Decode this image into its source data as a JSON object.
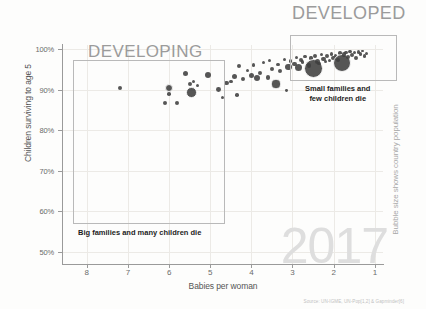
{
  "chart": {
    "type": "scatter",
    "title": "",
    "year_watermark": "2017",
    "source_note": "Source: UN-IGME, UN-Pop[1,2] & Gapminder[6]",
    "xlabel": "Babies per woman",
    "ylabel": "Children surviving to age 5",
    "right_label": "Bubble size shows country population"
  },
  "axes": {
    "x_ticks": [
      "8",
      "7",
      "6",
      "5",
      "4",
      "3",
      "2",
      "1"
    ],
    "y_ticks": [
      "100%",
      "90%",
      "80%",
      "70%",
      "60%",
      "50%"
    ],
    "xlim": [
      8.6,
      0.8
    ],
    "ylim": [
      47,
      101
    ],
    "x_reversed": true,
    "grid": true
  },
  "regions": [
    {
      "name": "developing",
      "heading": "DEVELOPING",
      "caption": "Big families and many children die",
      "x_range": [
        8.3,
        5.0
      ],
      "y_range": [
        55,
        95
      ]
    },
    {
      "name": "developed",
      "heading": "DEVELOPED",
      "caption_line1": "Small families and",
      "caption_line2": "few children die",
      "x_range": [
        3.0,
        1.0
      ],
      "y_range": [
        93,
        100
      ]
    }
  ],
  "colors": {
    "bubble": "#3f3f3f",
    "region_border": "#b9b9b9",
    "heading": "#9b9b9b",
    "watermark": "#dedede",
    "axis": "#9a9a9a",
    "grid": "#eceae6",
    "tick_text": "#6b6b6b"
  },
  "chart_data": {
    "type": "scatter",
    "xlabel": "Babies per woman",
    "ylabel": "Children surviving to age 5",
    "size_encoding": "Bubble size shows country population",
    "xlim": [
      8.6,
      0.8
    ],
    "ylim": [
      47,
      101
    ],
    "x_reversed": true,
    "grid": true,
    "legend": "none",
    "annotations": [
      "DEVELOPING",
      "DEVELOPED",
      "Big families and many children die",
      "Small families and few children die",
      "2017",
      "Bubble size shows country population"
    ],
    "points": [
      {
        "x": 7.2,
        "y": 90.3,
        "r": 2.0
      },
      {
        "x": 6.1,
        "y": 86.6,
        "r": 2.0
      },
      {
        "x": 6.0,
        "y": 90.4,
        "r": 4.2
      },
      {
        "x": 6.0,
        "y": 88.9,
        "r": 1.8
      },
      {
        "x": 5.8,
        "y": 86.8,
        "r": 2.0
      },
      {
        "x": 5.6,
        "y": 94.0,
        "r": 2.8
      },
      {
        "x": 5.5,
        "y": 91.4,
        "r": 2.0
      },
      {
        "x": 5.45,
        "y": 89.3,
        "r": 5.2
      },
      {
        "x": 5.4,
        "y": 92.0,
        "r": 1.8
      },
      {
        "x": 5.3,
        "y": 91.0,
        "r": 1.6
      },
      {
        "x": 5.05,
        "y": 93.7,
        "r": 3.0
      },
      {
        "x": 4.8,
        "y": 90.0,
        "r": 2.4
      },
      {
        "x": 4.7,
        "y": 88.0,
        "r": 1.6
      },
      {
        "x": 4.6,
        "y": 91.6,
        "r": 2.2
      },
      {
        "x": 4.5,
        "y": 92.0,
        "r": 1.8
      },
      {
        "x": 4.4,
        "y": 93.2,
        "r": 2.6
      },
      {
        "x": 4.35,
        "y": 88.6,
        "r": 1.8
      },
      {
        "x": 4.3,
        "y": 95.8,
        "r": 2.0
      },
      {
        "x": 4.2,
        "y": 92.6,
        "r": 2.2
      },
      {
        "x": 4.1,
        "y": 94.7,
        "r": 1.6
      },
      {
        "x": 4.0,
        "y": 93.4,
        "r": 2.6
      },
      {
        "x": 3.95,
        "y": 96.0,
        "r": 1.8
      },
      {
        "x": 3.85,
        "y": 92.8,
        "r": 3.0
      },
      {
        "x": 3.8,
        "y": 94.2,
        "r": 2.0
      },
      {
        "x": 3.7,
        "y": 96.6,
        "r": 1.6
      },
      {
        "x": 3.6,
        "y": 93.0,
        "r": 2.2
      },
      {
        "x": 3.55,
        "y": 97.2,
        "r": 1.6
      },
      {
        "x": 3.5,
        "y": 95.0,
        "r": 2.0
      },
      {
        "x": 3.4,
        "y": 91.4,
        "r": 4.6
      },
      {
        "x": 3.35,
        "y": 96.2,
        "r": 1.8
      },
      {
        "x": 3.3,
        "y": 94.6,
        "r": 2.0
      },
      {
        "x": 3.2,
        "y": 97.5,
        "r": 1.6
      },
      {
        "x": 3.15,
        "y": 89.8,
        "r": 1.4
      },
      {
        "x": 3.1,
        "y": 95.6,
        "r": 3.2
      },
      {
        "x": 3.05,
        "y": 97.0,
        "r": 1.8
      },
      {
        "x": 2.95,
        "y": 96.3,
        "r": 2.2
      },
      {
        "x": 2.9,
        "y": 98.0,
        "r": 1.6
      },
      {
        "x": 2.85,
        "y": 95.4,
        "r": 3.6
      },
      {
        "x": 2.8,
        "y": 97.4,
        "r": 2.0
      },
      {
        "x": 2.75,
        "y": 96.8,
        "r": 1.6
      },
      {
        "x": 2.7,
        "y": 98.2,
        "r": 1.8
      },
      {
        "x": 2.6,
        "y": 96.0,
        "r": 2.4
      },
      {
        "x": 2.55,
        "y": 97.8,
        "r": 1.6
      },
      {
        "x": 2.5,
        "y": 95.2,
        "r": 9.5
      },
      {
        "x": 2.45,
        "y": 98.4,
        "r": 2.0
      },
      {
        "x": 2.4,
        "y": 97.0,
        "r": 2.6
      },
      {
        "x": 2.35,
        "y": 96.4,
        "r": 1.8
      },
      {
        "x": 2.3,
        "y": 98.6,
        "r": 1.6
      },
      {
        "x": 2.25,
        "y": 97.6,
        "r": 2.2
      },
      {
        "x": 2.2,
        "y": 96.9,
        "r": 1.8
      },
      {
        "x": 2.15,
        "y": 98.2,
        "r": 2.0
      },
      {
        "x": 2.1,
        "y": 97.2,
        "r": 1.6
      },
      {
        "x": 2.05,
        "y": 98.8,
        "r": 1.8
      },
      {
        "x": 2.0,
        "y": 97.8,
        "r": 2.4
      },
      {
        "x": 1.95,
        "y": 98.4,
        "r": 1.6
      },
      {
        "x": 1.9,
        "y": 97.4,
        "r": 2.0
      },
      {
        "x": 1.85,
        "y": 99.0,
        "r": 1.8
      },
      {
        "x": 1.8,
        "y": 96.6,
        "r": 9.0
      },
      {
        "x": 1.75,
        "y": 98.7,
        "r": 2.2
      },
      {
        "x": 1.7,
        "y": 99.2,
        "r": 1.6
      },
      {
        "x": 1.65,
        "y": 98.0,
        "r": 2.0
      },
      {
        "x": 1.6,
        "y": 99.4,
        "r": 1.8
      },
      {
        "x": 1.55,
        "y": 98.5,
        "r": 2.2
      },
      {
        "x": 1.5,
        "y": 99.1,
        "r": 1.6
      },
      {
        "x": 1.45,
        "y": 97.9,
        "r": 2.0
      },
      {
        "x": 1.4,
        "y": 99.3,
        "r": 1.8
      },
      {
        "x": 1.35,
        "y": 98.8,
        "r": 1.6
      },
      {
        "x": 1.3,
        "y": 99.5,
        "r": 1.4
      },
      {
        "x": 1.25,
        "y": 98.3,
        "r": 1.8
      },
      {
        "x": 1.2,
        "y": 99.0,
        "r": 1.6
      }
    ]
  }
}
